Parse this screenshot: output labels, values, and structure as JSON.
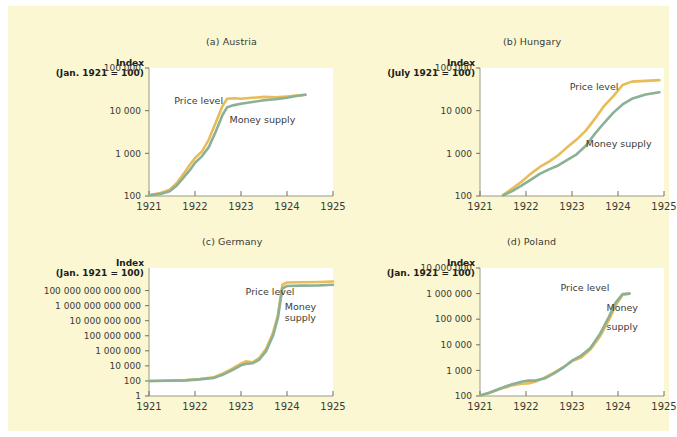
{
  "figure": {
    "background_color": "#faf7d2",
    "page_background": "#ffffff",
    "price_color": "#e8bc57",
    "money_color": "#8bb096"
  },
  "chart_data": [
    {
      "type": "line",
      "title": "(a) Austria",
      "index_label_line1": "Index",
      "index_label_line2": "(Jan. 1921 = 100)",
      "xlabel": "",
      "ylabel": "Index (Jan. 1921 = 100)",
      "xlim": [
        1921,
        1925
      ],
      "ylim": [
        100,
        100000
      ],
      "yscale": "log",
      "xticks": [
        "1921",
        "1922",
        "1923",
        "1924",
        "1925"
      ],
      "xtickvals": [
        1921,
        1922,
        1923,
        1924,
        1925
      ],
      "yticks": [
        "100",
        "1 000",
        "10 000",
        "100 000"
      ],
      "ytickvals": [
        100,
        1000,
        10000,
        100000
      ],
      "grid": false,
      "legend": "inline-annotations",
      "annotations": [
        {
          "text": "Price level",
          "x": 1921.55,
          "y": 14000
        },
        {
          "text": "Money supply",
          "x": 1922.75,
          "y": 5200
        }
      ],
      "series": [
        {
          "name": "Price level",
          "color": "#e8bc57",
          "x": [
            1921.0,
            1921.25,
            1921.45,
            1921.6,
            1921.75,
            1921.9,
            1922.0,
            1922.15,
            1922.3,
            1922.45,
            1922.6,
            1922.7,
            1922.85,
            1923.0,
            1923.25,
            1923.5,
            1923.75,
            1924.0,
            1924.2,
            1924.4
          ],
          "values": [
            105,
            118,
            140,
            200,
            330,
            560,
            780,
            1100,
            2100,
            5200,
            13000,
            19000,
            19500,
            19000,
            20000,
            21000,
            20500,
            21500,
            22500,
            23500
          ]
        },
        {
          "name": "Money supply",
          "color": "#8bb096",
          "x": [
            1921.0,
            1921.25,
            1921.45,
            1921.6,
            1921.75,
            1921.9,
            1922.0,
            1922.15,
            1922.3,
            1922.45,
            1922.6,
            1922.7,
            1922.85,
            1923.0,
            1923.25,
            1923.5,
            1923.75,
            1924.0,
            1924.2,
            1924.4
          ],
          "values": [
            103,
            112,
            130,
            175,
            270,
            420,
            600,
            850,
            1400,
            3200,
            8000,
            12000,
            13500,
            14500,
            16000,
            17500,
            18500,
            20000,
            22000,
            23500
          ]
        }
      ]
    },
    {
      "type": "line",
      "title": "(b) Hungary",
      "index_label_line1": "Index",
      "index_label_line2": "(July 1921 = 100)",
      "xlabel": "",
      "ylabel": "Index (July 1921 = 100)",
      "xlim": [
        1921,
        1925
      ],
      "ylim": [
        100,
        100000
      ],
      "yscale": "log",
      "xticks": [
        "1921",
        "1922",
        "1923",
        "1924",
        "1925"
      ],
      "xtickvals": [
        1921,
        1922,
        1923,
        1924,
        1925
      ],
      "yticks": [
        "100",
        "1 000",
        "10 000",
        "100 000"
      ],
      "ytickvals": [
        100,
        1000,
        10000,
        100000
      ],
      "grid": false,
      "legend": "inline-annotations",
      "annotations": [
        {
          "text": "Price level",
          "x": 1922.95,
          "y": 30000
        },
        {
          "text": "Money supply",
          "x": 1923.3,
          "y": 1400
        }
      ],
      "series": [
        {
          "name": "Price level",
          "color": "#e8bc57",
          "x": [
            1921.5,
            1921.7,
            1921.9,
            1922.1,
            1922.3,
            1922.5,
            1922.7,
            1922.9,
            1923.1,
            1923.3,
            1923.5,
            1923.7,
            1923.9,
            1924.1,
            1924.3,
            1924.6,
            1924.9
          ],
          "values": [
            105,
            150,
            215,
            330,
            480,
            640,
            900,
            1400,
            2100,
            3400,
            6500,
            13000,
            22000,
            40000,
            48000,
            50000,
            52000
          ]
        },
        {
          "name": "Money supply",
          "color": "#8bb096",
          "x": [
            1921.5,
            1921.7,
            1921.9,
            1922.1,
            1922.3,
            1922.5,
            1922.7,
            1922.9,
            1923.1,
            1923.3,
            1923.5,
            1923.7,
            1923.9,
            1924.1,
            1924.3,
            1924.6,
            1924.9
          ],
          "values": [
            103,
            130,
            175,
            240,
            330,
            420,
            520,
            700,
            950,
            1500,
            2900,
            5200,
            9000,
            14000,
            19000,
            24000,
            27000
          ]
        }
      ]
    },
    {
      "type": "line",
      "title": "(c) Germany",
      "index_label_line1": "Index",
      "index_label_line2": "(Jan. 1921 = 100)",
      "xlabel": "",
      "ylabel": "Index (Jan. 1921 = 100)",
      "xlim": [
        1921,
        1925
      ],
      "ylim": [
        1,
        100000000000000000
      ],
      "yscale": "log",
      "xticks": [
        "1921",
        "1922",
        "1923",
        "1924",
        "1925"
      ],
      "xtickvals": [
        1921,
        1922,
        1923,
        1924,
        1925
      ],
      "yticks": [
        "1",
        "100",
        "10 000",
        "1 000 000",
        "100 000 000",
        "10 000 000 000",
        "1 000 000 000 000",
        "100 000 000 000 000"
      ],
      "ytickvals": [
        1,
        100,
        10000,
        1000000,
        100000000,
        10000000000,
        1000000000000,
        100000000000000
      ],
      "grid": false,
      "legend": "inline-annotations",
      "annotations": [
        {
          "text": "Price level",
          "x": 1923.1,
          "y": 30000000000000
        },
        {
          "text": "Money",
          "x": 1923.95,
          "y": 300000000000
        },
        {
          "text": "supply",
          "x": 1923.95,
          "y": 9000000000
        }
      ],
      "series": [
        {
          "name": "Price level",
          "color": "#e8bc57",
          "x": [
            1921.0,
            1921.4,
            1921.8,
            1922.1,
            1922.4,
            1922.6,
            1922.8,
            1923.0,
            1923.1,
            1923.25,
            1923.4,
            1923.55,
            1923.7,
            1923.8,
            1923.9,
            1924.0,
            1924.3,
            1924.7,
            1925.0
          ],
          "values": [
            100,
            110,
            130,
            180,
            300,
            900,
            4000,
            20000,
            40000,
            30000,
            120000,
            2000000,
            300000000,
            50000000000,
            600000000000000,
            1200000000000000,
            1300000000000000,
            1400000000000000,
            1600000000000000
          ]
        },
        {
          "name": "Money supply",
          "color": "#8bb096",
          "x": [
            1921.0,
            1921.4,
            1921.8,
            1922.1,
            1922.4,
            1922.6,
            1922.8,
            1923.0,
            1923.1,
            1923.25,
            1923.4,
            1923.55,
            1923.7,
            1923.8,
            1923.9,
            1924.0,
            1924.3,
            1924.7,
            1925.0
          ],
          "values": [
            100,
            105,
            120,
            160,
            250,
            650,
            2500,
            12000,
            18000,
            22000,
            70000,
            1000000,
            120000000,
            20000000000,
            200000000000000,
            400000000000000,
            450000000000000,
            500000000000000,
            600000000000000
          ]
        }
      ]
    },
    {
      "type": "line",
      "title": "(d) Poland",
      "index_label_line1": "Index",
      "index_label_line2": "(Jan. 1921 = 100)",
      "xlabel": "",
      "ylabel": "Index (Jan. 1921 = 100)",
      "xlim": [
        1921,
        1925
      ],
      "ylim": [
        100,
        10000000
      ],
      "yscale": "log",
      "xticks": [
        "1921",
        "1922",
        "1923",
        "1924",
        "1925"
      ],
      "xtickvals": [
        1921,
        1922,
        1923,
        1924,
        1925
      ],
      "yticks": [
        "100",
        "1 000",
        "10 000",
        "100 000",
        "1 000 000",
        "10 000 000"
      ],
      "ytickvals": [
        100,
        1000,
        10000,
        100000,
        1000000,
        10000000
      ],
      "grid": false,
      "legend": "inline-annotations",
      "annotations": [
        {
          "text": "Price level",
          "x": 1922.75,
          "y": 1300000
        },
        {
          "text": "Money",
          "x": 1923.75,
          "y": 200000
        },
        {
          "text": "supply",
          "x": 1923.75,
          "y": 38000
        }
      ],
      "series": [
        {
          "name": "Price level",
          "color": "#e8bc57",
          "x": [
            1921.0,
            1921.2,
            1921.45,
            1921.7,
            1921.9,
            1922.05,
            1922.2,
            1922.4,
            1922.6,
            1922.8,
            1923.0,
            1923.2,
            1923.4,
            1923.6,
            1923.8,
            1923.95,
            1924.1,
            1924.25
          ],
          "values": [
            105,
            130,
            190,
            260,
            300,
            310,
            360,
            520,
            800,
            1300,
            2300,
            3200,
            6500,
            20000,
            90000,
            350000,
            900000,
            1000000
          ]
        },
        {
          "name": "Money supply",
          "color": "#8bb096",
          "x": [
            1921.0,
            1921.2,
            1921.45,
            1921.7,
            1921.9,
            1922.05,
            1922.2,
            1922.4,
            1922.6,
            1922.8,
            1923.0,
            1923.2,
            1923.4,
            1923.6,
            1923.8,
            1923.95,
            1924.1,
            1924.25
          ],
          "values": [
            105,
            135,
            200,
            290,
            360,
            400,
            400,
            480,
            750,
            1250,
            2400,
            3800,
            7500,
            25000,
            120000,
            450000,
            950000,
            1000000
          ]
        }
      ]
    }
  ]
}
